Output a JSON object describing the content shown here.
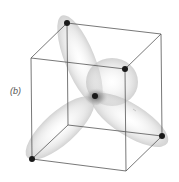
{
  "figure": {
    "panel_label": "(b)",
    "colors": {
      "edge": "#555555",
      "atom": "#1a1a1a",
      "lobe": "#cfcfcf",
      "background": "#ffffff"
    },
    "cube_vertices": {
      "top_back_left": [
        67,
        23
      ],
      "top_back_right": [
        161,
        34
      ],
      "top_front_left": [
        31,
        58
      ],
      "top_front_right": [
        125,
        69
      ],
      "bottom_back_left": [
        68,
        125
      ],
      "bottom_back_right": [
        162,
        136
      ],
      "bottom_front_left": [
        32,
        159
      ],
      "bottom_front_right": [
        126,
        171
      ]
    },
    "center_atom": [
      95,
      96
    ],
    "outer_atoms": [
      "top_back_left",
      "top_front_right",
      "bottom_front_left",
      "bottom_back_right"
    ]
  }
}
